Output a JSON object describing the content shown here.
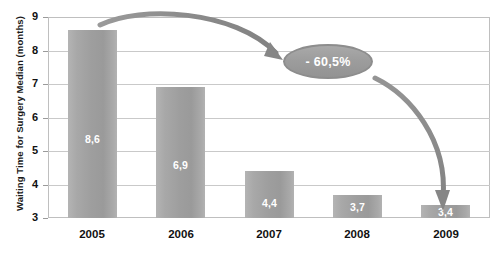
{
  "chart_data": {
    "type": "bar",
    "title": "",
    "subtitle": "",
    "xlabel": "",
    "ylabel": "Waiting Time for Surgery Median (months)",
    "categories": [
      "2005",
      "2006",
      "2007",
      "2008",
      "2009"
    ],
    "values": [
      8.6,
      6.9,
      4.4,
      3.7,
      3.4
    ],
    "value_labels": [
      "8,6",
      "6,9",
      "4,4",
      "3,7",
      "3,4"
    ],
    "ylim": [
      3,
      9
    ],
    "yticks": [
      3,
      4,
      5,
      6,
      7,
      8,
      9
    ],
    "ytick_labels": [
      "3",
      "4",
      "5",
      "6",
      "7",
      "8",
      "9"
    ],
    "grid": "horizontal",
    "legend": "none",
    "series": [
      {
        "name": "Waiting Time for Surgery Median (months)",
        "values": [
          8.6,
          6.9,
          4.4,
          3.7,
          3.4
        ]
      }
    ],
    "annotations": [
      {
        "name": "reduction-callout",
        "text": "- 60,5%",
        "shape": "ellipse",
        "from": "2005",
        "to": "2009"
      },
      {
        "name": "arrow-from-2005",
        "text": "",
        "shape": "curved-arrow"
      },
      {
        "name": "arrow-to-2009",
        "text": "",
        "shape": "curved-arrow"
      }
    ],
    "colors": {
      "bar": "#9e9e9e",
      "bar_light": "#b4b4b4",
      "callout_fill": "#9d9d9d",
      "callout_border": "#8d8d8d",
      "arrow": "#8c8c8c",
      "grid": "#c9c9c9",
      "axis": "#bfbfbf",
      "text": "#111111",
      "value_text": "#ffffff",
      "background": "#ffffff"
    }
  }
}
